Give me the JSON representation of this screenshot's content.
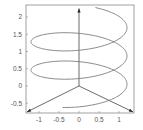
{
  "chart_data": {
    "type": "line",
    "title": "",
    "xlabel": "",
    "ylabel": "",
    "xlim": [
      -1.3,
      1.35
    ],
    "ylim": [
      -0.78,
      2.3
    ],
    "x_ticks": [
      "-1",
      "-0.5",
      "0",
      "0.5",
      "1"
    ],
    "y_ticks": [
      "2",
      "1.5",
      "1",
      "0.5",
      "0",
      "-0.5"
    ],
    "grid": false,
    "legend": null,
    "series": [
      {
        "name": "helix",
        "color": "#7a7a7a",
        "parametric": "x = cos(t), y = 0.45*sin(t) + 0.1*t (projected)",
        "turns": 2.5
      }
    ],
    "axes_arrows": [
      {
        "name": "z-axis",
        "from": [
          0,
          0
        ],
        "to": [
          0,
          2.25
        ]
      },
      {
        "name": "x-axis",
        "from": [
          0,
          0
        ],
        "to": [
          -1.3,
          -0.75
        ]
      },
      {
        "name": "y-axis",
        "from": [
          0,
          0
        ],
        "to": [
          1.35,
          -0.75
        ]
      }
    ]
  }
}
